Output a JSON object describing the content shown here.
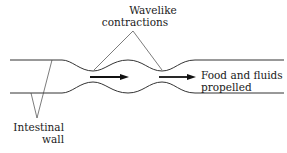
{
  "diagram": {
    "type": "peristalsis",
    "labels": {
      "wavelike": [
        "Wavelike",
        "contractions"
      ],
      "food": [
        "Food and fluids",
        "propelled"
      ],
      "wall": [
        "Intestinal",
        "wall"
      ]
    },
    "colors": {
      "line": "#333333",
      "arrow": "#111111",
      "text": "#1a1a1a",
      "background": "#ffffff"
    }
  }
}
